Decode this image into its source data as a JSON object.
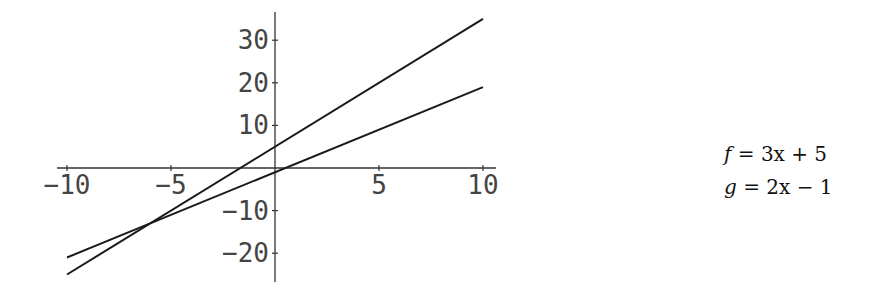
{
  "chart_data": {
    "type": "line",
    "title": "",
    "xlabel": "",
    "ylabel": "",
    "xlim": [
      -10,
      10
    ],
    "ylim": [
      -25,
      35
    ],
    "grid": false,
    "legend_position": "right",
    "x_ticks": [
      -10,
      -5,
      5,
      10
    ],
    "y_ticks": [
      -20,
      -10,
      10,
      20,
      30
    ],
    "x_tick_labels": [
      "-10",
      "-5",
      "5",
      "10"
    ],
    "y_tick_labels": [
      "-20",
      "-10",
      "10",
      "20",
      "30"
    ],
    "series": [
      {
        "name": "f = 3x + 5",
        "slope": 3,
        "intercept": 5,
        "x": [
          -10,
          10
        ],
        "values": [
          -25,
          35
        ]
      },
      {
        "name": "g = 2x - 1",
        "slope": 2,
        "intercept": -1,
        "x": [
          -10,
          10
        ],
        "values": [
          -21,
          19
        ]
      }
    ],
    "annotations": [
      "intersection at (-6, -13)"
    ]
  },
  "legend": {
    "f_label": "f",
    "f_rhs": "= 3x + 5",
    "g_label": "g",
    "g_rhs": "= 2x − 1"
  },
  "colors": {
    "line": "#1a1a1a",
    "axis": "#333333",
    "text": "#444444"
  }
}
